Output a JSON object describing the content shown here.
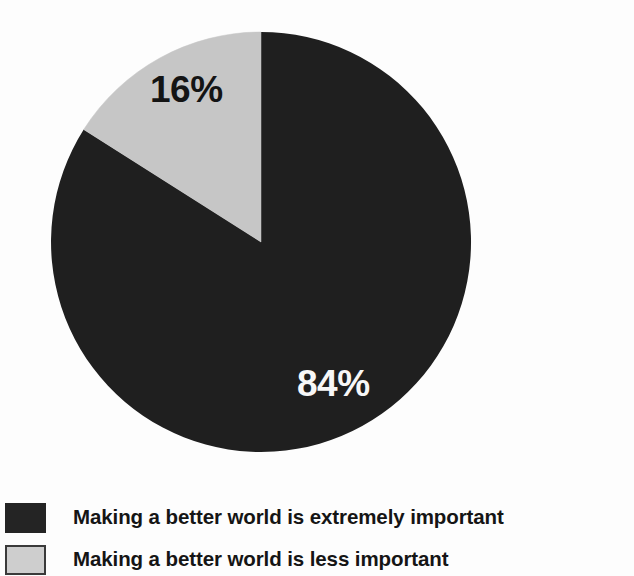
{
  "chart_data": {
    "type": "pie",
    "title": "",
    "subtitle": "",
    "xlabel": "",
    "ylabel": "",
    "legend_position": "bottom-left",
    "grid": false,
    "start_angle_deg": 0,
    "direction": "counterclockwise",
    "categories": [
      "Making a better world is extremely important",
      "Making a better world is less important"
    ],
    "values": [
      84,
      16
    ],
    "data_labels": [
      "84%",
      "16%"
    ],
    "colors": [
      "#1f1f1f",
      "#c6c6c6"
    ],
    "slices": [
      {
        "label": "Making a better world is extremely important",
        "value": 84,
        "data_label": "84%",
        "color": "#1f1f1f",
        "label_color": "#f7f7f7"
      },
      {
        "label": "Making a better world is less important",
        "value": 16,
        "data_label": "16%",
        "color": "#c6c6c6",
        "label_color": "#141414"
      }
    ]
  },
  "pie": {
    "center_x": 261,
    "center_y": 242,
    "radius": 210,
    "dark_label": "84%",
    "gray_label": "16%"
  },
  "legend": {
    "items": [
      {
        "swatch": "dark-swatch",
        "label": "Making a better world is extremely important"
      },
      {
        "swatch": "light-swatch",
        "label": "Making a better world is less important"
      }
    ]
  },
  "colors": {
    "background": "#fdfdfd",
    "dark_slice": "#1f1f1f",
    "light_slice": "#c6c6c6",
    "legend_dark_swatch": "#242424",
    "legend_light_swatch": "#cecece",
    "legend_light_swatch_border": "#3a3a3a",
    "text_dark": "#151515",
    "text_light": "#f7f7f7"
  }
}
